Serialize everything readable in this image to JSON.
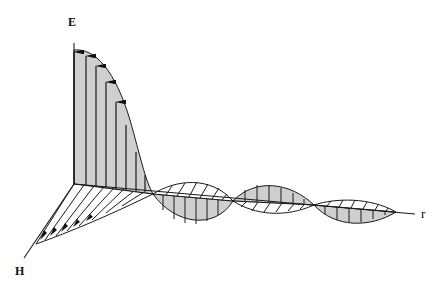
{
  "figure": {
    "labels": {
      "e_axis": "E",
      "h_axis": "H",
      "r_axis": "r"
    },
    "colors": {
      "e_fill": "#cfcfcf",
      "line": "#1a1a1a",
      "background": "#ffffff"
    }
  }
}
